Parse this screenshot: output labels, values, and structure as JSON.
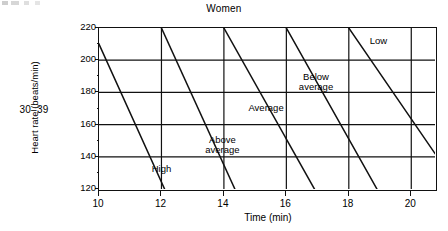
{
  "chart_data": {
    "type": "line",
    "title": "Women",
    "xlabel": "Time (min)",
    "ylabel": "Heart rate (beats/min)",
    "xlim": [
      10,
      20.76
    ],
    "ylim": [
      120,
      220
    ],
    "grid": true,
    "legend_position": "inline-zone-labels",
    "x_ticks": [
      10,
      12,
      14,
      16,
      18,
      20
    ],
    "x_tick_labels": [
      "10",
      "12",
      "14",
      "16",
      "18",
      "20"
    ],
    "y_ticks": [
      120,
      140,
      160,
      180,
      200,
      220
    ],
    "y_tick_labels": [
      "120",
      "140",
      "160",
      "180",
      "200",
      "220"
    ],
    "y_minor_ticks": [
      130,
      150,
      170,
      190,
      210
    ],
    "x_minor_ticks": [
      11,
      13,
      15,
      17,
      19
    ],
    "series": [
      {
        "name": "boundary-1",
        "x": [
          10.0,
          12.1
        ],
        "y": [
          210,
          120
        ]
      },
      {
        "name": "boundary-2",
        "x": [
          12.0,
          14.35
        ],
        "y": [
          220,
          120
        ]
      },
      {
        "name": "boundary-3",
        "x": [
          14.0,
          16.9
        ],
        "y": [
          220,
          120
        ]
      },
      {
        "name": "boundary-4",
        "x": [
          16.0,
          18.9
        ],
        "y": [
          220,
          120
        ]
      },
      {
        "name": "boundary-5",
        "x": [
          18.0,
          20.76
        ],
        "y": [
          220,
          142
        ]
      }
    ],
    "zones": [
      {
        "label": "High",
        "x": 12.0,
        "y": 132
      },
      {
        "label": "Above\naverage",
        "x": 13.95,
        "y": 150
      },
      {
        "label": "Average",
        "x": 15.35,
        "y": 170
      },
      {
        "label": "Below\naverage",
        "x": 16.95,
        "y": 189
      },
      {
        "label": "Low",
        "x": 18.95,
        "y": 211
      }
    ]
  },
  "page": {
    "age_group": "30–39"
  }
}
